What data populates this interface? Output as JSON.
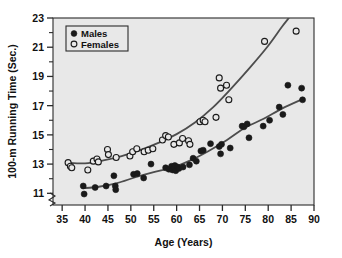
{
  "chart_data": {
    "type": "scatter",
    "title": "",
    "xlabel": "Age (Years)",
    "ylabel": "100-m Running Time (Sec.)",
    "xlim": [
      33,
      90
    ],
    "ylim": [
      10.2,
      23
    ],
    "xticks": [
      35,
      40,
      45,
      50,
      55,
      60,
      65,
      70,
      75,
      80,
      85,
      90
    ],
    "yticks": [
      11,
      13,
      15,
      17,
      19,
      21,
      23
    ],
    "y_minor_ticks": [
      12,
      14,
      16,
      18,
      20,
      22
    ],
    "grid": false,
    "axis_break": true,
    "legend_position": "top-left",
    "plot_background": "#e8e8e8",
    "series": [
      {
        "name": "Males",
        "marker": "filled-circle",
        "color": "#1a1a1a",
        "points": [
          [
            39.6,
            11.5
          ],
          [
            39.8,
            10.95
          ],
          [
            42.2,
            11.4
          ],
          [
            44.6,
            11.5
          ],
          [
            46.3,
            12.2
          ],
          [
            46.6,
            11.5
          ],
          [
            46.7,
            11.25
          ],
          [
            50.6,
            12.3
          ],
          [
            51.4,
            12.35
          ],
          [
            52.8,
            12.05
          ],
          [
            54.4,
            13.0
          ],
          [
            57.6,
            12.75
          ],
          [
            58.3,
            12.65
          ],
          [
            58.9,
            12.85
          ],
          [
            59.1,
            12.6
          ],
          [
            59.4,
            12.75
          ],
          [
            59.6,
            12.9
          ],
          [
            59.8,
            12.55
          ],
          [
            60.2,
            12.8
          ],
          [
            60.5,
            12.7
          ],
          [
            61.4,
            12.8
          ],
          [
            62.8,
            12.95
          ],
          [
            63.6,
            13.4
          ],
          [
            64.3,
            13.2
          ],
          [
            65.3,
            13.9
          ],
          [
            65.8,
            13.95
          ],
          [
            67.4,
            14.4
          ],
          [
            69.3,
            14.2
          ],
          [
            69.6,
            13.7
          ],
          [
            69.8,
            14.35
          ],
          [
            71.7,
            14.1
          ],
          [
            74.3,
            15.6
          ],
          [
            74.7,
            15.55
          ],
          [
            75.4,
            15.75
          ],
          [
            75.8,
            14.8
          ],
          [
            78.9,
            15.6
          ],
          [
            80.3,
            16.0
          ],
          [
            82.4,
            16.9
          ],
          [
            83.2,
            16.4
          ],
          [
            84.3,
            18.4
          ],
          [
            87.3,
            18.2
          ],
          [
            87.5,
            17.4
          ]
        ]
      },
      {
        "name": "Females",
        "marker": "open-circle",
        "color": "#1a1a1a",
        "points": [
          [
            36.3,
            13.1
          ],
          [
            36.8,
            12.85
          ],
          [
            37.1,
            12.75
          ],
          [
            40.6,
            12.6
          ],
          [
            41.8,
            13.2
          ],
          [
            42.6,
            13.35
          ],
          [
            42.9,
            13.15
          ],
          [
            44.9,
            14.0
          ],
          [
            45.1,
            13.65
          ],
          [
            46.8,
            13.45
          ],
          [
            49.8,
            13.55
          ],
          [
            50.4,
            13.85
          ],
          [
            51.3,
            14.05
          ],
          [
            52.9,
            13.85
          ],
          [
            53.8,
            13.95
          ],
          [
            54.8,
            14.05
          ],
          [
            56.9,
            14.65
          ],
          [
            57.6,
            14.95
          ],
          [
            58.2,
            14.85
          ],
          [
            59.4,
            14.35
          ],
          [
            60.6,
            14.45
          ],
          [
            61.3,
            14.75
          ],
          [
            62.6,
            14.6
          ],
          [
            62.9,
            14.35
          ],
          [
            65.1,
            15.9
          ],
          [
            65.8,
            16.0
          ],
          [
            66.2,
            15.9
          ],
          [
            68.6,
            16.2
          ],
          [
            69.3,
            18.9
          ],
          [
            69.6,
            18.2
          ],
          [
            70.9,
            18.4
          ],
          [
            71.4,
            17.4
          ],
          [
            79.2,
            21.4
          ],
          [
            86.1,
            22.1
          ]
        ]
      }
    ],
    "fit_curves": [
      {
        "name": "Males fit",
        "color": "#4d4d4d",
        "points": [
          [
            39.5,
            11.35
          ],
          [
            43,
            11.45
          ],
          [
            47,
            11.7
          ],
          [
            51,
            12.1
          ],
          [
            55,
            12.45
          ],
          [
            59,
            12.75
          ],
          [
            63,
            13.25
          ],
          [
            67,
            13.9
          ],
          [
            71,
            14.65
          ],
          [
            75,
            15.5
          ],
          [
            79,
            16.1
          ],
          [
            83,
            16.8
          ],
          [
            87.5,
            17.45
          ]
        ]
      },
      {
        "name": "Females fit",
        "color": "#4d4d4d",
        "points": [
          [
            36,
            13.1
          ],
          [
            40,
            13.05
          ],
          [
            44,
            13.25
          ],
          [
            48,
            13.55
          ],
          [
            52,
            13.95
          ],
          [
            56,
            14.45
          ],
          [
            60,
            15.05
          ],
          [
            64,
            15.85
          ],
          [
            68,
            16.9
          ],
          [
            72,
            18.2
          ],
          [
            76,
            19.6
          ],
          [
            80,
            21.1
          ],
          [
            83,
            22.4
          ],
          [
            84.5,
            23.0
          ]
        ]
      }
    ],
    "legend_entries": [
      {
        "label": "Males",
        "marker": "filled-circle"
      },
      {
        "label": "Females",
        "marker": "open-circle"
      }
    ]
  }
}
